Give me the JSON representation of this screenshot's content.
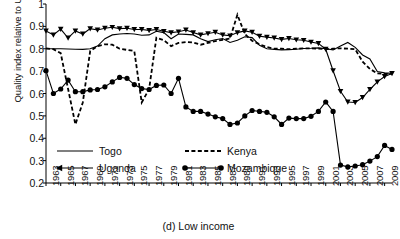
{
  "caption": "(d) Low income",
  "chart_data": {
    "type": "line",
    "title": "",
    "xlabel": "",
    "ylabel": "Quality index relative to USA",
    "ylim": [
      0.2,
      1.0
    ],
    "yticks": [
      "1",
      "0.9",
      "0.8",
      "0.7",
      "0.6",
      "0.5",
      "0.4",
      "0.3",
      "0.2"
    ],
    "ytick_values": [
      1.0,
      0.9,
      0.8,
      0.7,
      0.6,
      0.5,
      0.4,
      0.3,
      0.2
    ],
    "xlim": [
      1963,
      2010
    ],
    "xticks": [
      "1963",
      "1965",
      "1967",
      "1969",
      "1971",
      "1973",
      "1975",
      "1977",
      "1979",
      "1981",
      "1983",
      "1985",
      "1987",
      "1989",
      "1991",
      "1993",
      "1995",
      "1997",
      "1999",
      "2001",
      "2003",
      "2005",
      "2007",
      "2009"
    ],
    "xtick_values": [
      1963,
      1965,
      1967,
      1969,
      1971,
      1973,
      1975,
      1977,
      1979,
      1981,
      1983,
      1985,
      1987,
      1989,
      1991,
      1993,
      1995,
      1997,
      1999,
      2001,
      2003,
      2005,
      2007,
      2009
    ],
    "grid": false,
    "legend_position": "inside-bottom-left",
    "x": [
      1963,
      1964,
      1965,
      1966,
      1967,
      1968,
      1969,
      1970,
      1971,
      1972,
      1973,
      1974,
      1975,
      1976,
      1977,
      1978,
      1979,
      1980,
      1981,
      1982,
      1983,
      1984,
      1985,
      1986,
      1987,
      1988,
      1989,
      1990,
      1991,
      1992,
      1993,
      1994,
      1995,
      1996,
      1997,
      1998,
      1999,
      2000,
      2001,
      2002,
      2003,
      2004,
      2005,
      2006,
      2007,
      2008,
      2009,
      2010
    ],
    "series": [
      {
        "name": "Togo",
        "style": "solid",
        "marker": "none",
        "color": "#000000",
        "values": [
          0.8,
          0.8,
          0.8,
          0.799,
          0.798,
          0.797,
          0.8,
          0.812,
          0.845,
          0.862,
          0.866,
          0.868,
          0.866,
          0.86,
          0.862,
          0.878,
          0.872,
          0.845,
          0.866,
          0.864,
          0.862,
          0.845,
          0.832,
          0.84,
          0.846,
          0.828,
          0.838,
          0.854,
          0.85,
          0.816,
          0.8,
          0.797,
          0.795,
          0.796,
          0.798,
          0.801,
          0.802,
          0.804,
          0.8,
          0.795,
          0.812,
          0.828,
          0.806,
          0.772,
          0.754,
          0.698,
          0.692,
          0.69
        ]
      },
      {
        "name": "Uganda",
        "style": "solid",
        "marker": "triangle",
        "color": "#000000",
        "values": [
          0.88,
          0.862,
          0.888,
          0.848,
          0.88,
          0.866,
          0.89,
          0.884,
          0.892,
          0.896,
          0.89,
          0.892,
          0.886,
          0.886,
          0.882,
          0.886,
          0.878,
          0.872,
          0.876,
          0.884,
          0.872,
          0.862,
          0.868,
          0.874,
          0.862,
          0.858,
          0.872,
          0.88,
          0.874,
          0.856,
          0.852,
          0.848,
          0.842,
          0.846,
          0.84,
          0.838,
          0.83,
          0.824,
          0.798,
          0.702,
          0.61,
          0.562,
          0.56,
          0.582,
          0.618,
          0.652,
          0.676,
          0.69
        ]
      },
      {
        "name": "Kenya",
        "style": "dashed",
        "marker": "none",
        "color": "#000000",
        "values": [
          0.802,
          0.798,
          0.78,
          0.62,
          0.462,
          0.56,
          0.79,
          0.812,
          0.82,
          0.818,
          0.8,
          0.795,
          0.79,
          0.56,
          0.62,
          0.85,
          0.838,
          0.812,
          0.826,
          0.83,
          0.828,
          0.818,
          0.826,
          0.834,
          0.84,
          0.846,
          0.952,
          0.866,
          0.836,
          0.82,
          0.808,
          0.8,
          0.8,
          0.798,
          0.8,
          0.802,
          0.802,
          0.8,
          0.798,
          0.8,
          0.802,
          0.8,
          0.798,
          0.742,
          0.71,
          0.69,
          0.688,
          0.688
        ]
      },
      {
        "name": "Mozambique",
        "style": "solid",
        "marker": "circle",
        "color": "#000000",
        "values": [
          0.702,
          0.6,
          0.62,
          0.66,
          0.608,
          0.608,
          0.616,
          0.618,
          0.63,
          0.652,
          0.672,
          0.668,
          0.64,
          0.622,
          0.618,
          0.636,
          0.638,
          0.6,
          0.668,
          0.54,
          0.52,
          0.52,
          0.508,
          0.496,
          0.488,
          0.462,
          0.468,
          0.5,
          0.524,
          0.52,
          0.516,
          0.496,
          0.462,
          0.49,
          0.488,
          0.488,
          0.498,
          0.52,
          0.562,
          0.52,
          0.28,
          0.272,
          0.276,
          0.282,
          0.298,
          0.318,
          0.368,
          0.35
        ]
      }
    ]
  },
  "legend": [
    {
      "label": "Togo",
      "style": "solid",
      "marker": "none"
    },
    {
      "label": "Uganda",
      "style": "solid",
      "marker": "triangle"
    },
    {
      "label": "Kenya",
      "style": "dashed",
      "marker": "none"
    },
    {
      "label": "Mozambique",
      "style": "solid",
      "marker": "circle"
    }
  ]
}
